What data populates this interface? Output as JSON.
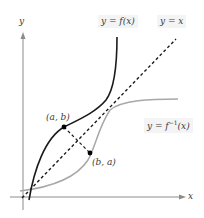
{
  "diagram": {
    "axes": {
      "x_label": "x",
      "y_label": "y"
    },
    "curves": {
      "f": {
        "label": "y = f(x)",
        "color": "#1a1a1a"
      },
      "identity": {
        "label": "y = x",
        "color": "#1a1a1a",
        "style": "dashed"
      },
      "f_inverse": {
        "label_prefix": "y = f",
        "label_sup": "−1",
        "label_suffix": "(x)",
        "color": "#a8a8a8"
      }
    },
    "points": {
      "p1": {
        "label": "(a, b)"
      },
      "p2": {
        "label": "(b, a)"
      }
    },
    "colors": {
      "axis": "#8c8c8c",
      "label_bg": "#f4f4f4",
      "text": "#3a3a3a"
    }
  }
}
